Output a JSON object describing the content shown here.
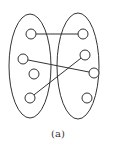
{
  "caption": "(a)",
  "colors": {
    "stroke": "#333333",
    "background": "#ffffff"
  },
  "sets": [
    {
      "id": "left",
      "cx": 30,
      "cy": 66,
      "rx": 21,
      "ry": 52
    },
    {
      "id": "right",
      "cx": 78,
      "cy": 66,
      "rx": 21,
      "ry": 53
    }
  ],
  "nodes": [
    {
      "id": "L1",
      "x": 31,
      "y": 34
    },
    {
      "id": "L2",
      "x": 23,
      "y": 59
    },
    {
      "id": "L3",
      "x": 34,
      "y": 74
    },
    {
      "id": "L4",
      "x": 30,
      "y": 98
    },
    {
      "id": "R1",
      "x": 83,
      "y": 34
    },
    {
      "id": "R2",
      "x": 85,
      "y": 55
    },
    {
      "id": "R3",
      "x": 94,
      "y": 73
    },
    {
      "id": "R4",
      "x": 87,
      "y": 98
    }
  ],
  "edges": [
    {
      "from": "L1",
      "to": "R1"
    },
    {
      "from": "L2",
      "to": "R3"
    },
    {
      "from": "L4",
      "to": "R2"
    }
  ],
  "node_radius": 5
}
